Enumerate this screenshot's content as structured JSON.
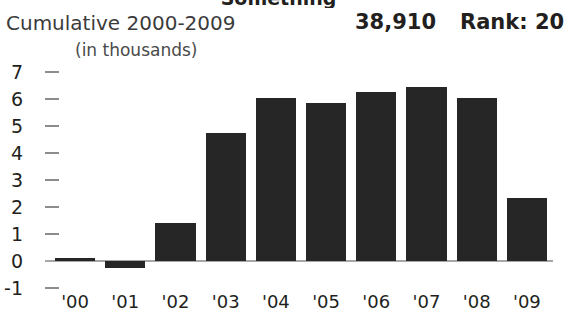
{
  "widget": {
    "clipped_title": "Something",
    "header": {
      "label": "Cumulative 2000-2009",
      "value": "38,910",
      "rank": "Rank: 20"
    },
    "subtitle": "(in thousands)"
  },
  "chart_data": {
    "type": "bar",
    "title": "Cumulative 2000-2009",
    "subtitle": "(in thousands)",
    "xlabel": "",
    "ylabel": "",
    "categories": [
      "'00",
      "'01",
      "'02",
      "'03",
      "'04",
      "'05",
      "'06",
      "'07",
      "'08",
      "'09"
    ],
    "values": [
      0.1,
      -0.25,
      1.4,
      4.75,
      6.05,
      5.85,
      6.25,
      6.45,
      6.05,
      2.35
    ],
    "ylim": [
      -1,
      7
    ],
    "ytick_labels": [
      "7",
      "6",
      "5",
      "4",
      "3",
      "2",
      "1",
      "0",
      "-1"
    ],
    "ytick_values": [
      7,
      6,
      5,
      4,
      3,
      2,
      1,
      0,
      -1
    ],
    "grid": false,
    "legend": "none",
    "bar_color": "#262626",
    "axis_color": "#a6a6a6",
    "total_label": "38,910",
    "rank_label": "Rank: 20"
  }
}
